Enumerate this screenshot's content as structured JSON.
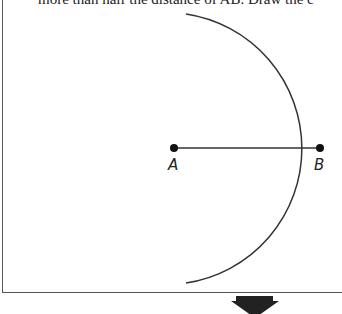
{
  "header": {
    "text": "more than half the distance of AB. Draw the c"
  },
  "diagram": {
    "points": [
      {
        "label": "A",
        "x": 174,
        "y": 148
      },
      {
        "label": "B",
        "x": 320,
        "y": 148
      }
    ],
    "segment": {
      "from": "A",
      "to": "B"
    },
    "arc": {
      "center": "A",
      "radius": 136,
      "start": [
        186,
        14
      ],
      "end": [
        186,
        283
      ]
    },
    "arrow": {
      "direction": "down",
      "color": "#222222"
    }
  }
}
